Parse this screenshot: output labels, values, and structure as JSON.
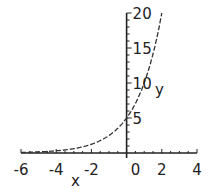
{
  "chart_data": {
    "type": "line",
    "title": "",
    "xlabel": "x",
    "ylabel": "y",
    "xlim": [
      -6,
      4
    ],
    "ylim": [
      0,
      20
    ],
    "grid": false,
    "legend": null,
    "x_ticks": [
      -6,
      -4,
      -2,
      0,
      2,
      4
    ],
    "y_ticks": [
      5,
      10,
      15,
      20
    ],
    "x_tick_labels": [
      "-6",
      "-4",
      "-2",
      "0",
      "2",
      "4"
    ],
    "y_tick_labels": [
      "5",
      "10",
      "15",
      "20"
    ],
    "series": [
      {
        "name": "y = 5·2^x",
        "style": "dashed",
        "x": [
          -6,
          -5,
          -4,
          -3,
          -2,
          -1,
          0,
          0.5,
          1,
          1.5,
          2
        ],
        "y": [
          0.08,
          0.16,
          0.31,
          0.63,
          1.25,
          2.5,
          5,
          7.07,
          10,
          14.14,
          20
        ]
      }
    ]
  }
}
